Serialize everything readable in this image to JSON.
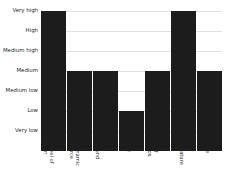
{
  "chart_data": {
    "type": "bar",
    "title": "",
    "xlabel": "",
    "ylabel": "",
    "categories": [
      "Grip level of abrasion",
      "Aerodynamic downforce",
      "Tyre compound",
      "Braking",
      "Level of tortuosos",
      "Temperature range",
      "Average speed"
    ],
    "category_lines": [
      [
        "Grip level of",
        "abrasion"
      ],
      [
        "Aerodynamic",
        "downforce"
      ],
      [
        "Tyre",
        "compound"
      ],
      [
        "Braking",
        ""
      ],
      [
        "Level of",
        "tortuosos"
      ],
      [
        "Temperature",
        "range"
      ],
      [
        "Average",
        "speed"
      ]
    ],
    "values": [
      7,
      4,
      4,
      2,
      4,
      7,
      4
    ],
    "value_labels": [
      "Very high",
      "Medium",
      "Medium",
      "Low",
      "Medium",
      "Very high",
      "Medium"
    ],
    "ytick_labels": [
      "Very high",
      "High",
      "Medium high",
      "Medium",
      "Medium low",
      "Low",
      "Very low"
    ],
    "ytick_values": [
      7,
      6,
      5,
      4,
      3,
      2,
      1
    ],
    "ylim": [
      0,
      7
    ],
    "grid": true,
    "legend": "none",
    "bar_color": "#1c1c1c",
    "grid_color": "#e2e2e2",
    "background_color": "#ffffff"
  }
}
